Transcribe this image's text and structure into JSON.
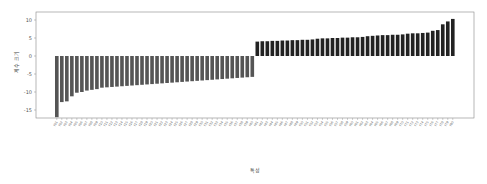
{
  "chart_data": {
    "type": "bar",
    "title": "",
    "xlabel": "특성",
    "ylabel": "계수 크기",
    "ylim": [
      -18,
      12
    ],
    "yticks": [
      10,
      5,
      0,
      -5,
      -10,
      -15
    ],
    "grid": false,
    "legend": null,
    "colors": {
      "negative": "#555555",
      "positive": "#222222",
      "frame": "#888888"
    },
    "categories": [
      "f01",
      "f02",
      "f03",
      "f04",
      "f05",
      "f06",
      "f07",
      "f08",
      "f09",
      "f10",
      "f11",
      "f12",
      "f13",
      "f14",
      "f15",
      "f16",
      "f17",
      "f18",
      "f19",
      "f20",
      "f21",
      "f22",
      "f23",
      "f24",
      "f25",
      "f26",
      "f27",
      "f28",
      "f29",
      "f30",
      "f31",
      "f32",
      "f33",
      "f34",
      "f35",
      "f36",
      "f37",
      "f38",
      "f39",
      "f40",
      "f41",
      "f42",
      "f43",
      "f44",
      "f45",
      "f46",
      "f47",
      "f48",
      "f49",
      "f50",
      "f51",
      "f52",
      "f53",
      "f54",
      "f55",
      "f56",
      "f57",
      "f58",
      "f59",
      "f60",
      "f61",
      "f62",
      "f63",
      "f64",
      "f65",
      "f66",
      "f67",
      "f68",
      "f69",
      "f70",
      "f71",
      "f72",
      "f73",
      "f74",
      "f75",
      "f76",
      "f77",
      "f78",
      "f79",
      "f80"
    ],
    "values": [
      -17.0,
      -12.8,
      -12.6,
      -11.2,
      -10.2,
      -10.0,
      -9.6,
      -9.4,
      -9.2,
      -8.8,
      -8.7,
      -8.6,
      -8.5,
      -8.4,
      -8.3,
      -8.2,
      -8.1,
      -8.0,
      -7.9,
      -7.8,
      -7.7,
      -7.6,
      -7.5,
      -7.4,
      -7.3,
      -7.2,
      -7.1,
      -7.0,
      -6.9,
      -6.8,
      -6.7,
      -6.6,
      -6.5,
      -6.4,
      -6.3,
      -6.2,
      -6.1,
      -6.0,
      -5.9,
      -5.8,
      4.0,
      4.1,
      4.1,
      4.2,
      4.2,
      4.3,
      4.3,
      4.4,
      4.4,
      4.5,
      4.5,
      4.6,
      4.8,
      4.9,
      4.9,
      5.0,
      5.0,
      5.1,
      5.1,
      5.2,
      5.2,
      5.3,
      5.5,
      5.6,
      5.7,
      5.8,
      5.8,
      5.9,
      5.9,
      6.0,
      6.2,
      6.3,
      6.3,
      6.4,
      6.5,
      7.0,
      7.2,
      8.8,
      9.6,
      10.3
    ]
  }
}
